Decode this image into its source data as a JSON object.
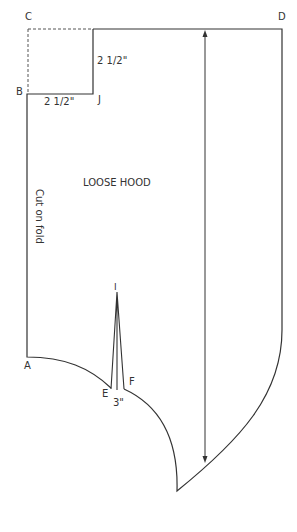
{
  "diagram": {
    "title": "LOOSE HOOD",
    "fold_label": "Cut on fold",
    "points": {
      "A": "A",
      "B": "B",
      "C": "C",
      "D": "D",
      "E": "E",
      "F": "F",
      "I": "I",
      "J": "J"
    },
    "measurements": {
      "notch_vertical": "2 1/2\"",
      "notch_horizontal": "2 1/2\"",
      "dart_width": "3\""
    },
    "colors": {
      "line": "#333333",
      "background": "#ffffff"
    }
  }
}
